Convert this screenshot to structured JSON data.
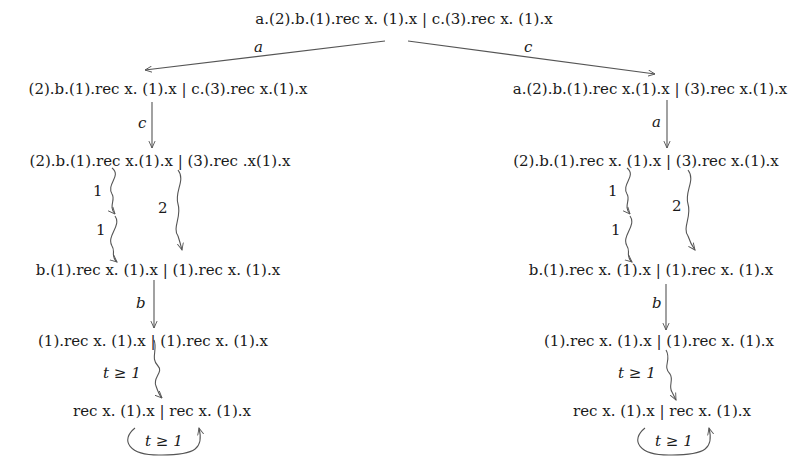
{
  "root": {
    "term": "a.(2).b.(1).rec x. (1).x | c.(3).rec x. (1).x"
  },
  "root_edges": {
    "left_label": "a",
    "right_label": "c"
  },
  "left_branch": {
    "nodes": [
      "(2).b.(1).rec x. (1).x | c.(3).rec x.(1).x",
      "(2).b.(1).rec x.(1).x | (3).rec .x(1).x",
      "b.(1).rec x. (1).x | (1).rec x. (1).x",
      "(1).rec x. (1).x | (1).rec x. (1).x",
      "rec x. (1).x | rec x. (1).x"
    ],
    "edges": {
      "e1": "c",
      "e2_step1": "1",
      "e2_step2": "1",
      "e2_parallel": "2",
      "e3": "b",
      "e4": "t ≥ 1",
      "loop": "t ≥ 1"
    }
  },
  "right_branch": {
    "nodes": [
      "a.(2).b.(1).rec x.(1).x | (3).rec x.(1).x",
      "(2).b.(1).rec x. (1).x | (3).rec x.(1).x",
      "b.(1).rec x. (1).x | (1).rec x. (1).x",
      "(1).rec x. (1).x | (1).rec x. (1).x",
      "rec x. (1).x | rec x. (1).x"
    ],
    "edges": {
      "e1": "a",
      "e2_step1": "1",
      "e2_step2": "1",
      "e2_parallel": "2",
      "e3": "b",
      "e4": "t ≥ 1",
      "loop": "t ≥ 1"
    }
  }
}
